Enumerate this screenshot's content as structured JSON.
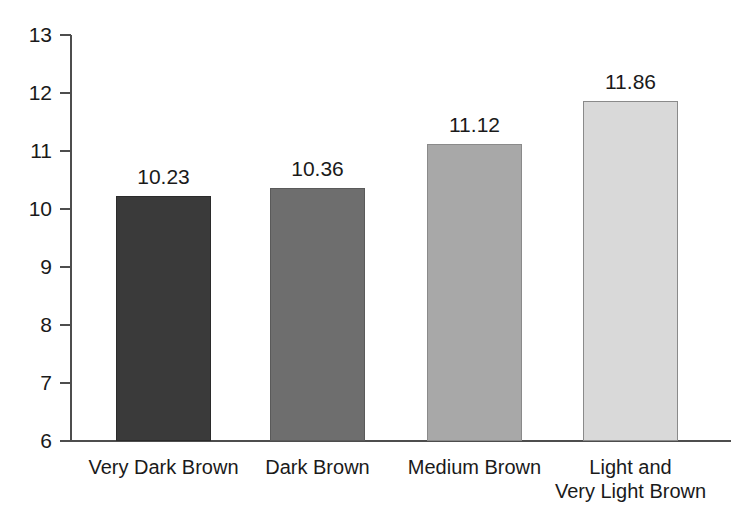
{
  "chart_data": {
    "type": "bar",
    "title": "",
    "xlabel": "",
    "ylabel": "",
    "ylim": [
      6,
      13
    ],
    "yticks": [
      6,
      7,
      8,
      9,
      10,
      11,
      12,
      13
    ],
    "ytick_labels": [
      "6",
      "7",
      "8",
      "9",
      "10",
      "11",
      "12",
      "13"
    ],
    "grid": false,
    "legend": false,
    "categories": [
      "Very Dark Brown",
      "Dark Brown",
      "Medium Brown",
      "Light and Very Light Brown"
    ],
    "category_lines": [
      [
        "Very Dark Brown"
      ],
      [
        "Dark Brown"
      ],
      [
        "Medium Brown"
      ],
      [
        "Light and",
        "Very Light Brown"
      ]
    ],
    "values": [
      10.23,
      10.36,
      11.12,
      11.86
    ],
    "value_labels": [
      "10.23",
      "10.36",
      "11.12",
      "11.86"
    ],
    "bar_colors": [
      "#3a3a3a",
      "#6e6e6e",
      "#a8a8a8",
      "#d9d9d9"
    ],
    "bar_edge_colors": [
      "#2b2b2b",
      "#5a5a5a",
      "#8a8a8a",
      "#8a8a8a"
    ],
    "axis_color": "#4d4d4d",
    "text_color": "#1a1a1a",
    "background": "#ffffff"
  }
}
